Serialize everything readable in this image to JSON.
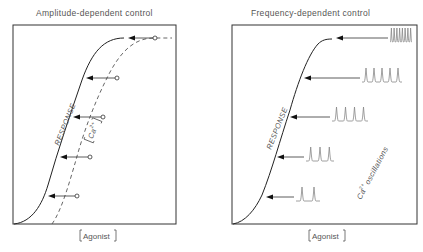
{
  "panels": [
    {
      "id": "amplitude",
      "title": "Amplitude-dependent control",
      "x_label": "Agonist",
      "response_label": "RESPONSE",
      "curve_label": "Ca",
      "curve_label_sup": "2+",
      "arrows": 5,
      "response_levels": [
        0.08,
        0.38,
        0.62,
        0.78,
        0.95
      ]
    },
    {
      "id": "frequency",
      "title": "Frequency-dependent control",
      "x_label": "Agonist",
      "response_label": "RESPONSE",
      "oscillations_label": "Ca",
      "oscillations_sup": "2+",
      "oscillations_text": "oscillations",
      "arrows": 5,
      "spike_counts": [
        2,
        3,
        4,
        5,
        8
      ],
      "response_levels": [
        0.08,
        0.38,
        0.62,
        0.78,
        0.95
      ]
    }
  ]
}
